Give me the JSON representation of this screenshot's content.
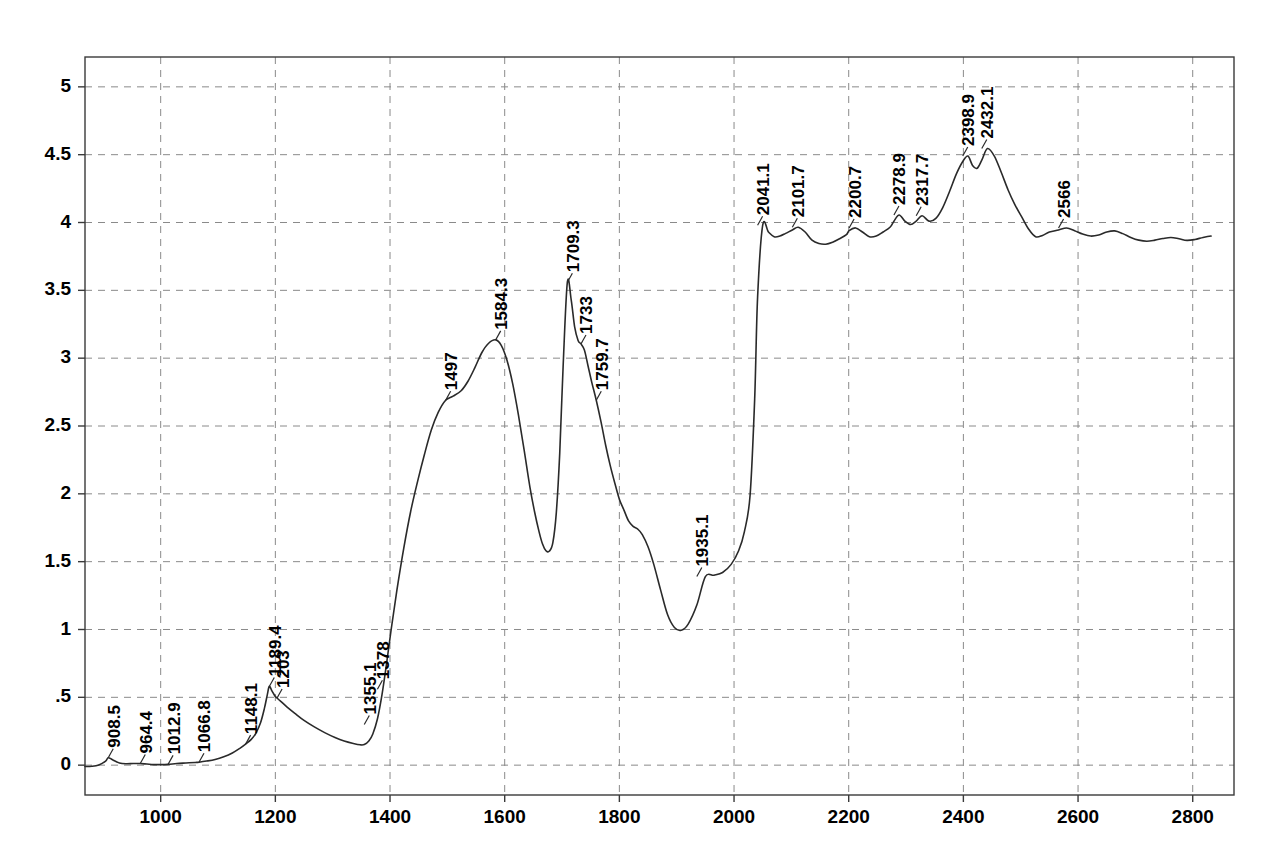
{
  "chart_data": {
    "type": "line",
    "title": "",
    "subtitle": "",
    "xlabel": "",
    "ylabel": "",
    "xlim": [
      868,
      2872
    ],
    "ylim": [
      -0.22,
      5.22
    ],
    "grid": true,
    "legend": "none",
    "legend_entries": [],
    "line_color": "#2a2a2a",
    "grid_color": "#8a8a8a",
    "frame_color": "#3a3a3a",
    "background": "#ffffff",
    "xticks": [
      1000,
      1200,
      1400,
      1600,
      1800,
      2000,
      2200,
      2400,
      2600,
      2800
    ],
    "xtick_labels": [
      "1000",
      "1200",
      "1400",
      "1600",
      "1800",
      "2000",
      "2200",
      "2400",
      "2600",
      "2800"
    ],
    "yticks": [
      0,
      0.5,
      1,
      1.5,
      2,
      2.5,
      3,
      3.5,
      4,
      4.5,
      5
    ],
    "ytick_labels": [
      "0",
      ".5",
      "1",
      "1.5",
      "2",
      "2.5",
      "3",
      "3.5",
      "4",
      "4.5",
      "5"
    ],
    "annotations": [
      {
        "label": "908.5",
        "x": 908.5,
        "y": 0.055
      },
      {
        "label": "964.4",
        "x": 964.4,
        "y": 0.012
      },
      {
        "label": "1012.9",
        "x": 1012.9,
        "y": 0.006
      },
      {
        "label": "1066.8",
        "x": 1066.8,
        "y": 0.022
      },
      {
        "label": "1148.1",
        "x": 1148.1,
        "y": 0.155
      },
      {
        "label": "1189.4",
        "x": 1189.4,
        "y": 0.58
      },
      {
        "label": "1203",
        "x": 1203.0,
        "y": 0.495
      },
      {
        "label": "1355.1",
        "x": 1355.1,
        "y": 0.3
      },
      {
        "label": "1378",
        "x": 1378.0,
        "y": 0.56
      },
      {
        "label": "1497",
        "x": 1497.0,
        "y": 2.69
      },
      {
        "label": "1584.3",
        "x": 1584.3,
        "y": 3.135
      },
      {
        "label": "1709.3",
        "x": 1709.3,
        "y": 3.56
      },
      {
        "label": "1733",
        "x": 1733.0,
        "y": 3.105
      },
      {
        "label": "1759.7",
        "x": 1759.7,
        "y": 2.69
      },
      {
        "label": "1935.1",
        "x": 1935.1,
        "y": 1.39
      },
      {
        "label": "2041.1",
        "x": 2041.1,
        "y": 3.98
      },
      {
        "label": "2101.7",
        "x": 2101.7,
        "y": 3.965
      },
      {
        "label": "2200.7",
        "x": 2200.7,
        "y": 3.96
      },
      {
        "label": "2278.9",
        "x": 2278.9,
        "y": 4.055
      },
      {
        "label": "2317.7",
        "x": 2317.7,
        "y": 4.05
      },
      {
        "label": "2398.9",
        "x": 2398.9,
        "y": 4.49
      },
      {
        "label": "2432.1",
        "x": 2432.1,
        "y": 4.545
      },
      {
        "label": "2566",
        "x": 2566.0,
        "y": 3.96
      }
    ],
    "x": [
      868,
      880,
      892,
      904,
      908.5,
      916,
      928,
      940,
      952,
      964.4,
      976,
      988,
      1000,
      1012.9,
      1028,
      1044,
      1060,
      1066.8,
      1080,
      1095,
      1110,
      1125,
      1138,
      1148.1,
      1158,
      1166,
      1174,
      1181,
      1186,
      1189.4,
      1194,
      1199,
      1203,
      1210,
      1220,
      1234,
      1250,
      1268,
      1286,
      1304,
      1320,
      1336,
      1348,
      1355.1,
      1363,
      1370,
      1378,
      1386,
      1394,
      1402,
      1412,
      1424,
      1436,
      1448,
      1460,
      1472,
      1484,
      1497,
      1510,
      1524,
      1536,
      1548,
      1560,
      1572,
      1584.3,
      1594,
      1604,
      1614,
      1624,
      1634,
      1644,
      1652,
      1660,
      1666,
      1672,
      1678,
      1684,
      1690,
      1696,
      1702,
      1709.3,
      1716,
      1722,
      1728,
      1733,
      1739,
      1745,
      1752,
      1759.7,
      1768,
      1776,
      1784,
      1792,
      1800,
      1808,
      1816,
      1824,
      1832,
      1840,
      1850,
      1860,
      1872,
      1884,
      1896,
      1908,
      1920,
      1935.1,
      1950,
      1965,
      1980,
      1995,
      2008,
      2018,
      2028,
      2036,
      2041.1,
      2050,
      2060,
      2070,
      2080,
      2090,
      2101.7,
      2112,
      2124,
      2136,
      2148,
      2160,
      2172,
      2184,
      2196,
      2200.7,
      2212,
      2224,
      2236,
      2248,
      2260,
      2272,
      2278.9,
      2288,
      2298,
      2308,
      2317.7,
      2328,
      2340,
      2352,
      2364,
      2376,
      2388,
      2398.9,
      2408,
      2416,
      2424,
      2432.1,
      2442,
      2454,
      2466,
      2478,
      2490,
      2502,
      2514,
      2526,
      2538,
      2550,
      2566,
      2580,
      2594,
      2608,
      2622,
      2636,
      2650,
      2664,
      2678,
      2692,
      2706,
      2720,
      2734,
      2748,
      2762,
      2776,
      2790,
      2804,
      2818,
      2832,
      2846,
      2860,
      2872
    ],
    "y": [
      -0.01,
      -0.008,
      0.002,
      0.03,
      0.055,
      0.04,
      0.016,
      0.01,
      0.012,
      0.012,
      0.008,
      0.004,
      0.004,
      0.006,
      0.012,
      0.016,
      0.02,
      0.022,
      0.03,
      0.042,
      0.062,
      0.09,
      0.124,
      0.155,
      0.19,
      0.235,
      0.31,
      0.42,
      0.52,
      0.58,
      0.548,
      0.512,
      0.495,
      0.468,
      0.43,
      0.382,
      0.33,
      0.282,
      0.24,
      0.204,
      0.178,
      0.16,
      0.15,
      0.152,
      0.178,
      0.23,
      0.34,
      0.52,
      0.75,
      1.0,
      1.29,
      1.6,
      1.87,
      2.09,
      2.29,
      2.47,
      2.6,
      2.69,
      2.72,
      2.76,
      2.83,
      2.93,
      3.04,
      3.11,
      3.135,
      3.095,
      2.985,
      2.81,
      2.58,
      2.32,
      2.05,
      1.87,
      1.72,
      1.63,
      1.58,
      1.578,
      1.64,
      1.86,
      2.3,
      2.95,
      3.56,
      3.43,
      3.23,
      3.13,
      3.105,
      3.06,
      2.95,
      2.82,
      2.69,
      2.53,
      2.36,
      2.21,
      2.08,
      1.96,
      1.88,
      1.8,
      1.76,
      1.74,
      1.7,
      1.61,
      1.48,
      1.29,
      1.11,
      1.015,
      0.995,
      1.04,
      1.18,
      1.39,
      1.4,
      1.42,
      1.48,
      1.58,
      1.72,
      1.99,
      2.7,
      3.45,
      3.98,
      3.93,
      3.895,
      3.9,
      3.92,
      3.945,
      3.965,
      3.93,
      3.87,
      3.845,
      3.84,
      3.855,
      3.88,
      3.91,
      3.94,
      3.96,
      3.93,
      3.895,
      3.9,
      3.93,
      3.965,
      4.01,
      4.055,
      4.01,
      3.985,
      4.01,
      4.05,
      4.01,
      4.03,
      4.11,
      4.23,
      4.36,
      4.45,
      4.49,
      4.42,
      4.4,
      4.46,
      4.545,
      4.49,
      4.37,
      4.24,
      4.13,
      4.04,
      3.95,
      3.895,
      3.905,
      3.93,
      3.945,
      3.96,
      3.94,
      3.915,
      3.9,
      3.908,
      3.93,
      3.938,
      3.918,
      3.89,
      3.87,
      3.862,
      3.87,
      3.882,
      3.89,
      3.88,
      3.868,
      3.875,
      3.89,
      3.9,
      3.902
    ]
  },
  "geometry": {
    "plot_left": 85,
    "plot_right": 1234,
    "plot_top": 57,
    "plot_bottom": 795
  }
}
